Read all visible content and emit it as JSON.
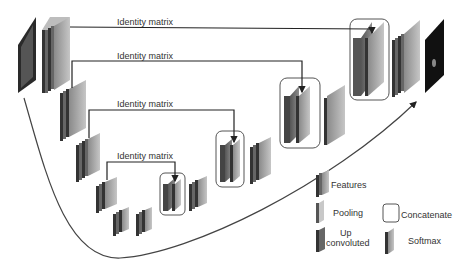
{
  "diagram": {
    "title": "",
    "skip_connections": [
      {
        "label": "Identity matrix",
        "level": 1
      },
      {
        "label": "Identity matrix",
        "level": 2
      },
      {
        "label": "Identity matrix",
        "level": 3
      },
      {
        "label": "Identity matrix",
        "level": 4
      }
    ],
    "legend": {
      "features": "Features",
      "pooling": "Pooling",
      "up_convoluted_line1": "Up",
      "up_convoluted_line2": "convoluted",
      "concatenate": "Concatenate",
      "softmax": "Softmax"
    },
    "colors": {
      "features_dark": "#4a4a4a",
      "features_light": "#a8a8a8",
      "pooling": "#c8c8c8",
      "line": "#222222",
      "output_bg": "#111111"
    }
  }
}
